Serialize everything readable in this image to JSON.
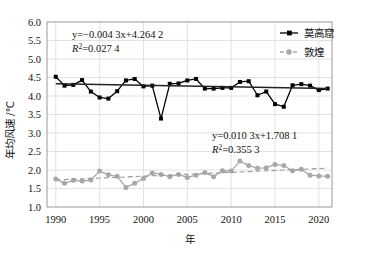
{
  "chart_data": {
    "type": "line",
    "title": "",
    "xlabel": "年",
    "ylabel": "年均风速 /℃",
    "xlim": [
      1989,
      2021.5
    ],
    "ylim": [
      1.0,
      6.0
    ],
    "ytick_labels": [
      "6.0",
      "5.5",
      "5.0",
      "4.5",
      "4.0",
      "3.5",
      "3.0",
      "2.5",
      "2.0",
      "1.5",
      "1.0"
    ],
    "ytick_values": [
      6.0,
      5.5,
      5.0,
      4.5,
      4.0,
      3.5,
      3.0,
      2.5,
      2.0,
      1.5,
      1.0
    ],
    "xtick_labels": [
      "1990",
      "1995",
      "2000",
      "2005",
      "2010",
      "2015",
      "2020"
    ],
    "xtick_values": [
      1990,
      1995,
      2000,
      2005,
      2010,
      2015,
      2020
    ],
    "grid": true,
    "legend_position": "top-right",
    "x": [
      1990,
      1991,
      1992,
      1993,
      1994,
      1995,
      1996,
      1997,
      1998,
      1999,
      2000,
      2001,
      2002,
      2003,
      2004,
      2005,
      2006,
      2007,
      2008,
      2009,
      2010,
      2011,
      2012,
      2013,
      2014,
      2015,
      2016,
      2017,
      2018,
      2019,
      2020,
      2021
    ],
    "series": [
      {
        "name": "莫高窟",
        "color": "#000000",
        "marker": "square",
        "linestyle": "solid",
        "values": [
          4.52,
          4.28,
          4.3,
          4.43,
          4.12,
          3.96,
          3.93,
          4.13,
          4.42,
          4.46,
          4.26,
          4.28,
          3.39,
          4.33,
          4.34,
          4.42,
          4.46,
          4.2,
          4.2,
          4.22,
          4.22,
          4.38,
          4.4,
          4.02,
          4.12,
          3.78,
          3.71,
          4.29,
          4.32,
          4.28,
          4.16,
          4.2
        ],
        "trend": {
          "equation": "y=−0.004 3x+4.264 2",
          "r2": "R2=0.027 4",
          "slope": -0.0043,
          "intercept": 4.2642,
          "y_start": 4.33,
          "y_end": 4.2
        }
      },
      {
        "name": "敦煌",
        "color": "#a8a8a8",
        "marker": "circle",
        "linestyle": "dashed",
        "values": [
          1.76,
          1.64,
          1.72,
          1.7,
          1.73,
          1.97,
          1.87,
          1.83,
          1.53,
          1.64,
          1.77,
          1.92,
          1.88,
          1.82,
          1.88,
          1.8,
          1.86,
          1.93,
          1.82,
          1.98,
          1.97,
          2.24,
          2.12,
          2.05,
          2.06,
          2.15,
          2.12,
          1.98,
          2.02,
          1.86,
          1.84,
          1.83
        ],
        "trend": {
          "equation": "y=0.010 3x+1.708 1",
          "r2": "R2=0.355 3",
          "slope": 0.0103,
          "intercept": 1.7081,
          "y_start": 1.73,
          "y_end": 2.05
        }
      }
    ],
    "annotations": [
      {
        "id": "mogao-equation",
        "line1": "y=−0.004 3x+4.264 2",
        "line2_base": "R",
        "line2_sup": "2",
        "line2_rest": "=0.027 4"
      },
      {
        "id": "dunhuang-equation",
        "line1": "y=0.010 3x+1.708 1",
        "line2_base": "R",
        "line2_sup": "2",
        "line2_rest": "=0.355 3"
      }
    ],
    "legend": [
      {
        "label": "莫高窟",
        "color": "#000000",
        "marker": "square",
        "linestyle": "solid"
      },
      {
        "label": "敦煌",
        "color": "#a8a8a8",
        "marker": "circle",
        "linestyle": "dashed"
      }
    ]
  }
}
